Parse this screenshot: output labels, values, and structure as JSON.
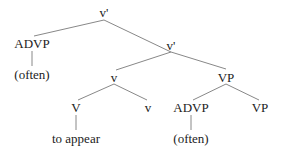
{
  "tree": {
    "nodes": [
      {
        "id": "root",
        "label": "v'",
        "x": 104,
        "y": 6
      },
      {
        "id": "advp1",
        "label": "ADVP",
        "x": 32,
        "y": 37
      },
      {
        "id": "often1",
        "label": "(often)",
        "x": 32,
        "y": 68
      },
      {
        "id": "vbar",
        "label": "v'",
        "x": 171,
        "y": 39
      },
      {
        "id": "v_small",
        "label": "v",
        "x": 114,
        "y": 71
      },
      {
        "id": "vp1",
        "label": "VP",
        "x": 226,
        "y": 71
      },
      {
        "id": "V",
        "label": "V",
        "x": 76,
        "y": 101
      },
      {
        "id": "v2",
        "label": "v",
        "x": 148,
        "y": 101
      },
      {
        "id": "advp2",
        "label": "ADVP",
        "x": 191,
        "y": 101
      },
      {
        "id": "vp2",
        "label": "VP",
        "x": 260,
        "y": 101
      },
      {
        "id": "toappear",
        "label": "to appear",
        "x": 76,
        "y": 132
      },
      {
        "id": "often2",
        "label": "(often)",
        "x": 191,
        "y": 132
      }
    ],
    "edges": [
      [
        104,
        20,
        34,
        36
      ],
      [
        104,
        20,
        171,
        52
      ],
      [
        32,
        51,
        32,
        66
      ],
      [
        171,
        52,
        116,
        70
      ],
      [
        171,
        52,
        226,
        69
      ],
      [
        114,
        84,
        78,
        100
      ],
      [
        114,
        84,
        147,
        100
      ],
      [
        226,
        84,
        193,
        100
      ],
      [
        226,
        84,
        259,
        100
      ],
      [
        76,
        115,
        76,
        130
      ],
      [
        191,
        115,
        191,
        130
      ]
    ],
    "edge_color": "#888888"
  }
}
